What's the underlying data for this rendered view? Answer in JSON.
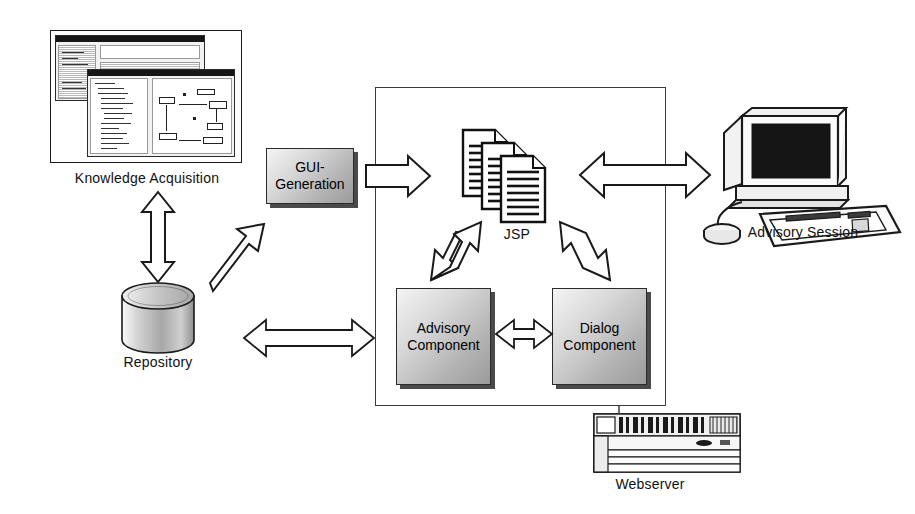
{
  "diagram": {
    "nodes": {
      "knowledge_acquisition": {
        "label": "Knowledge Acquisition",
        "icon": "screenshot-thumbnail-icon"
      },
      "gui_generation": {
        "label_line1": "GUI-",
        "label_line2": "Generation",
        "fill": "#d0d0d0",
        "shadow": "#4a4a4a"
      },
      "repository": {
        "label": "Repository",
        "icon": "database-cylinder-icon",
        "fill": "#c9c9c9"
      },
      "jsp": {
        "label": "JSP",
        "icon": "documents-stack-icon",
        "count": 3
      },
      "advisory_component": {
        "label_line1": "Advisory",
        "label_line2": "Component",
        "fill": "#d0d0d0",
        "shadow": "#4a4a4a"
      },
      "dialog_component": {
        "label_line1": "Dialog",
        "label_line2": "Component",
        "fill": "#d0d0d0",
        "shadow": "#4a4a4a"
      },
      "advisory_session": {
        "label": "Advisory Session",
        "icon": "desktop-computer-icon"
      },
      "webserver": {
        "label": "Webserver",
        "icon": "rack-server-icon"
      }
    },
    "connectors": [
      {
        "name": "knowledge-acquisition-to-repository",
        "style": "double-headed-hollow-arrow",
        "orientation": "vertical"
      },
      {
        "name": "repository-to-gui-generation",
        "style": "single-headed-hollow-arrow",
        "orientation": "diagonal-up-right"
      },
      {
        "name": "gui-generation-to-container",
        "style": "single-headed-hollow-arrow",
        "orientation": "horizontal-right"
      },
      {
        "name": "repository-to-container",
        "style": "double-headed-hollow-arrow",
        "orientation": "horizontal"
      },
      {
        "name": "jsp-to-advisory-session",
        "style": "double-headed-hollow-arrow",
        "orientation": "horizontal"
      },
      {
        "name": "jsp-to-advisory-component",
        "style": "double-headed-hollow-arrow",
        "orientation": "diagonal"
      },
      {
        "name": "jsp-to-dialog-component",
        "style": "double-headed-hollow-arrow",
        "orientation": "diagonal"
      },
      {
        "name": "advisory-component-to-dialog-component",
        "style": "double-headed-hollow-arrow",
        "orientation": "horizontal"
      },
      {
        "name": "container-to-webserver",
        "style": "plain-line",
        "orientation": "vertical"
      }
    ],
    "colors": {
      "stroke": "#1a1a1a",
      "container_stroke": "#3b3b3b",
      "box_fill_light": "#f4f4f4",
      "box_fill_dark": "#9b9b9b",
      "background": "#ffffff"
    }
  }
}
